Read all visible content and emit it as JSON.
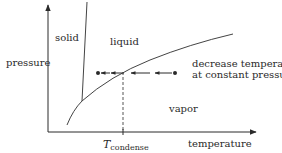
{
  "figure": {
    "type": "phase-diagram",
    "axes": {
      "x_label": "temperature",
      "y_label": "pressure"
    },
    "regions": {
      "solid": "solid",
      "liquid": "liquid",
      "vapor": "vapor"
    },
    "annotation": {
      "line1": "decrease temperature",
      "line2": "at constant pressure"
    },
    "marker": {
      "symbol": "T",
      "subscript": "condense"
    },
    "colors": {
      "ink": "#2a2a2a",
      "background": "#ffffff"
    }
  }
}
